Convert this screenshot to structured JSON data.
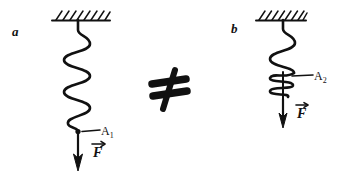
{
  "figure": {
    "background_color": "#ffffff",
    "ink_color": "#111111",
    "width": 338,
    "height": 183,
    "relation_symbol": "≠",
    "relation_name": "not-equal-sign"
  },
  "panels": [
    {
      "id": "a",
      "letter": "a",
      "support": {
        "name": "hatched-ceiling",
        "hatch_count": 8,
        "x_start": 52,
        "x_end": 110,
        "y": 20
      },
      "spring": {
        "name": "extended-spring",
        "state": "extended",
        "coil_count": 5,
        "top_y": 20,
        "bottom_y": 131,
        "axis_x": 78
      },
      "point": {
        "name": "attachment-point-a1",
        "label": "A",
        "subscript": "1",
        "x": 78,
        "y": 131
      },
      "force": {
        "name": "force-vector-f",
        "label": "F",
        "vector_accent": "arrow",
        "direction": "down",
        "arrow_top_y": 133,
        "arrow_bottom_y": 170
      }
    },
    {
      "id": "b",
      "letter": "b",
      "support": {
        "name": "hatched-ceiling",
        "hatch_count": 8,
        "x_start": 256,
        "x_end": 306,
        "y": 20
      },
      "spring": {
        "name": "compressed-spring",
        "state": "partially-compressed",
        "loose_coil_count": 3,
        "tight_coil_count": 4,
        "top_y": 20,
        "bottom_y": 99,
        "axis_x": 283
      },
      "point": {
        "name": "attachment-point-a2",
        "label": "A",
        "subscript": "2",
        "x": 283,
        "y": 77
      },
      "force": {
        "name": "force-vector-f",
        "label": "F",
        "vector_accent": "arrow",
        "direction": "down",
        "arrow_top_y": 100,
        "arrow_bottom_y": 128
      }
    }
  ],
  "labels": {
    "panel_a_letter": "a",
    "panel_b_letter": "b",
    "point_a1_base": "A",
    "point_a1_sub": "1",
    "point_a2_base": "A",
    "point_a2_sub": "2",
    "force_a": "F",
    "force_b": "F",
    "relation": "≠"
  }
}
